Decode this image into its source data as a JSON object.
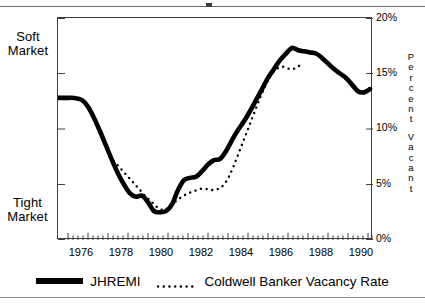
{
  "axes": {
    "y_right_ticks": [
      "20%",
      "15%",
      "10%",
      "5%",
      "0%"
    ],
    "y_right_title_chars": [
      "P",
      "e",
      "r",
      "c",
      "e",
      "n",
      "t",
      "V",
      "a",
      "c",
      "a",
      "n",
      "t"
    ],
    "y_right_title": "Percent Vacant",
    "x_ticks": [
      "1976",
      "1978",
      "1980",
      "1982",
      "1984",
      "1986",
      "1988",
      "1990"
    ],
    "left_top_label": "Soft Market",
    "left_top_label_line1": "Soft",
    "left_top_label_line2": "Market",
    "left_bottom_label": "Tight Market",
    "left_bottom_label_line1": "Tight",
    "left_bottom_label_line2": "Market"
  },
  "legend": {
    "items": [
      {
        "label": "JHREMI",
        "style": "solid-thick",
        "swatch": "solid-line-swatch"
      },
      {
        "label": "Coldwell Banker Vacancy Rate",
        "style": "dotted",
        "swatch": "dotted-line-swatch"
      }
    ]
  },
  "colors": {
    "series_primary": "#000000",
    "series_secondary": "#000000",
    "frame": "#3d3d3d",
    "background": "#ffffff"
  },
  "chart_data": {
    "type": "line",
    "title": "",
    "xlabel": "",
    "ylabel": "Percent Vacant",
    "xlim": [
      1975.5,
      1991.25
    ],
    "ylim": [
      0,
      20
    ],
    "grid": false,
    "legend_position": "bottom",
    "x_tick_values": [
      1976,
      1978,
      1980,
      1982,
      1984,
      1986,
      1988,
      1990
    ],
    "y_tick_values": [
      0,
      5,
      10,
      15,
      20
    ],
    "y_tick_labels": [
      "0%",
      "5%",
      "10%",
      "15%",
      "20%"
    ],
    "minor_ticks": "quarterly",
    "annotations": [
      {
        "text": "Soft Market",
        "position": "left-axis-top"
      },
      {
        "text": "Tight Market",
        "position": "left-axis-bottom"
      }
    ],
    "series": [
      {
        "name": "JHREMI",
        "style": "solid-thick",
        "x": [
          1975.5,
          1975.9,
          1976.3,
          1976.7,
          1977.0,
          1977.3,
          1977.6,
          1977.9,
          1978.2,
          1978.5,
          1978.8,
          1979.1,
          1979.4,
          1979.7,
          1980.0,
          1980.3,
          1980.6,
          1980.9,
          1981.2,
          1981.5,
          1981.8,
          1982.1,
          1982.4,
          1982.7,
          1983.0,
          1983.3,
          1983.6,
          1983.9,
          1984.2,
          1984.5,
          1984.8,
          1985.1,
          1985.4,
          1985.7,
          1986.0,
          1986.3,
          1986.6,
          1986.9,
          1987.2,
          1987.5,
          1987.8,
          1988.1,
          1988.4,
          1988.7,
          1989.0,
          1989.3,
          1989.6,
          1989.9,
          1990.2,
          1990.5,
          1990.8,
          1991.1
        ],
        "y": [
          12.8,
          12.8,
          12.8,
          12.6,
          12.0,
          11.0,
          9.8,
          8.5,
          7.2,
          6.0,
          5.0,
          4.2,
          3.9,
          4.0,
          3.4,
          2.6,
          2.5,
          2.6,
          3.2,
          4.5,
          5.4,
          5.6,
          5.7,
          6.2,
          6.8,
          7.2,
          7.3,
          8.0,
          9.0,
          9.9,
          10.7,
          11.6,
          12.6,
          13.6,
          14.6,
          15.4,
          16.2,
          16.8,
          17.3,
          17.1,
          17.0,
          16.9,
          16.8,
          16.4,
          15.9,
          15.4,
          15.0,
          14.6,
          14.0,
          13.4,
          13.3,
          13.6
        ]
      },
      {
        "name": "Coldwell Banker Vacancy Rate",
        "style": "dotted",
        "x": [
          1978.1,
          1978.4,
          1978.7,
          1979.0,
          1979.3,
          1979.6,
          1979.9,
          1980.2,
          1980.5,
          1980.8,
          1981.1,
          1981.4,
          1981.7,
          1982.0,
          1982.3,
          1982.6,
          1982.9,
          1983.2,
          1983.5,
          1983.8,
          1984.1,
          1984.4,
          1984.7,
          1985.0,
          1985.3,
          1985.6,
          1985.9,
          1986.2,
          1986.5,
          1986.8,
          1987.1,
          1987.4,
          1987.7
        ],
        "y": [
          7.5,
          6.9,
          6.3,
          5.7,
          5.1,
          4.5,
          3.9,
          3.4,
          2.9,
          2.7,
          3.0,
          3.5,
          3.9,
          4.2,
          4.4,
          4.6,
          4.6,
          4.5,
          4.6,
          5.0,
          5.9,
          7.2,
          8.6,
          10.0,
          11.4,
          12.8,
          14.0,
          15.0,
          15.5,
          15.6,
          15.4,
          15.5,
          15.9
        ]
      }
    ]
  }
}
